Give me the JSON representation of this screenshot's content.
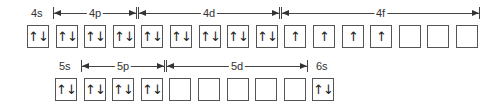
{
  "diagram": {
    "type": "orbital-box-diagram",
    "rows": [
      {
        "name": "row-4",
        "y": 25,
        "start_x": 27,
        "pitch": 28.6,
        "subshells": [
          {
            "label": "4s",
            "boxes": [
              "↑↓"
            ],
            "bracket": false
          },
          {
            "label": "4p",
            "boxes": [
              "↑↓",
              "↑↓",
              "↑↓"
            ],
            "bracket": true
          },
          {
            "label": "4d",
            "boxes": [
              "↑↓",
              "↑↓",
              "↑↓",
              "↑↓",
              "↑↓"
            ],
            "bracket": true
          },
          {
            "label": "4f",
            "boxes": [
              "↑",
              "↑",
              "↑",
              "↑",
              "",
              "",
              ""
            ],
            "bracket": true
          }
        ]
      },
      {
        "name": "row-5",
        "y": 78,
        "start_x": 55,
        "pitch": 28.6,
        "subshells": [
          {
            "label": "5s",
            "boxes": [
              "↑↓"
            ],
            "bracket": false
          },
          {
            "label": "5p",
            "boxes": [
              "↑↓",
              "↑↓",
              "↑↓"
            ],
            "bracket": true
          },
          {
            "label": "5d",
            "boxes": [
              "",
              "",
              "",
              "",
              ""
            ],
            "bracket": true
          },
          {
            "label": "6s",
            "boxes": [
              "↑↓"
            ],
            "bracket": false
          }
        ]
      }
    ]
  }
}
